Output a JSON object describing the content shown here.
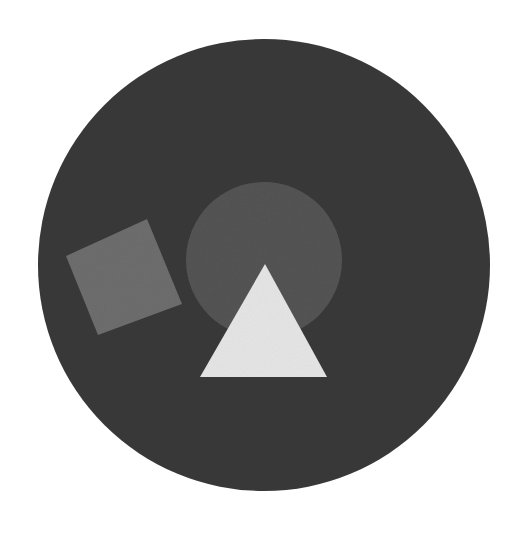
{
  "canvas": {
    "width": 517,
    "height": 540,
    "background": "#ffffff"
  },
  "shapes": {
    "outer_circle": {
      "cx": 264,
      "cy": 265,
      "r": 226,
      "color": "#3a3a3a"
    },
    "inner_circle": {
      "cx": 264,
      "cy": 260,
      "r": 78,
      "color": "#555555"
    },
    "square": {
      "points": "66,256 147,219 182,304 98,335",
      "color": "#6e6e6e"
    },
    "triangle": {
      "points": "265,264 200,377 327,377",
      "color": "#e6e6e6"
    }
  }
}
